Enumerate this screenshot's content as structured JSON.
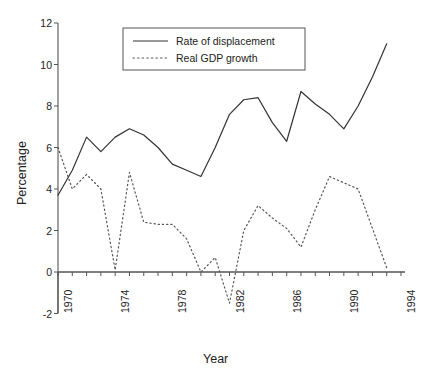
{
  "chart_data": {
    "type": "line",
    "title": "",
    "xlabel": "Year",
    "ylabel": "Percentage",
    "xlim": [
      1970,
      1994
    ],
    "ylim": [
      -2,
      12
    ],
    "ytick_values": [
      12,
      10,
      8,
      6,
      4,
      2,
      0,
      -2
    ],
    "ytick_labels": [
      "12",
      "10",
      "8",
      "6",
      "4",
      "2",
      "0",
      "-2"
    ],
    "xtick_values": [
      1970,
      1974,
      1978,
      1982,
      1986,
      1990,
      1994
    ],
    "xtick_labels": [
      "1970",
      "1974",
      "1978",
      "1982",
      "1986",
      "1990",
      "1994"
    ],
    "xtick_minor_step": 1,
    "grid": false,
    "legend_position": "top-center",
    "zero_line": true,
    "x": [
      1970,
      1971,
      1972,
      1973,
      1974,
      1975,
      1976,
      1977,
      1978,
      1979,
      1980,
      1981,
      1982,
      1983,
      1984,
      1985,
      1986,
      1987,
      1988,
      1989,
      1990,
      1991,
      1992,
      1993
    ],
    "series": [
      {
        "name": "Rate of displacement",
        "style": "solid",
        "color": "#333333",
        "x": [
          1970,
          1971,
          1972,
          1973,
          1974,
          1975,
          1976,
          1977,
          1978,
          1979,
          1980,
          1981,
          1982,
          1983,
          1984,
          1985,
          1986,
          1987,
          1988,
          1989,
          1990,
          1991,
          1992,
          1993
        ],
        "values": [
          3.7,
          4.9,
          6.5,
          5.8,
          6.5,
          6.9,
          6.6,
          6.0,
          5.2,
          4.9,
          4.6,
          6.0,
          7.6,
          8.3,
          8.4,
          7.2,
          6.3,
          8.7,
          8.1,
          7.6,
          6.9,
          8.0,
          9.4,
          11.0
        ]
      },
      {
        "name": "Real GDP growth",
        "style": "dotted",
        "color": "#555555",
        "x": [
          1970,
          1971,
          1972,
          1973,
          1974,
          1975,
          1976,
          1977,
          1978,
          1979,
          1980,
          1981,
          1982,
          1983,
          1984,
          1985,
          1986,
          1987,
          1988,
          1989,
          1990,
          1991,
          1992,
          1993
        ],
        "values": [
          6.0,
          4.0,
          4.7,
          4.0,
          0.1,
          4.8,
          2.4,
          2.3,
          2.3,
          1.6,
          0.0,
          0.7,
          -1.5,
          2.0,
          3.2,
          2.6,
          2.1,
          1.2,
          3.0,
          4.6,
          4.3,
          4.0,
          2.1,
          0.2
        ]
      }
    ]
  },
  "legend": {
    "entries": [
      {
        "label": "Rate of displacement",
        "style": "solid"
      },
      {
        "label": "Real GDP growth",
        "style": "dotted"
      }
    ]
  }
}
